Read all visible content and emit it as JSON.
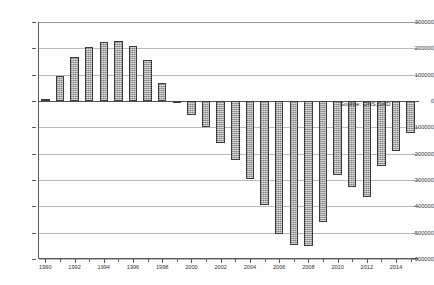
{
  "chart_data": {
    "type": "bar",
    "title": "",
    "subtitle": "",
    "xlabel": "",
    "ylabel": "",
    "ylim": [
      -600000,
      300000
    ],
    "ytick_step": 100000,
    "grid": true,
    "legend": false,
    "annotation": "Source: ONS,GAD",
    "ytick_labels": [
      "300000",
      "200000",
      "100000",
      "0",
      "-100000",
      "-200000",
      "-300000",
      "-400000",
      "-500000",
      "-600000"
    ],
    "ytick_values": [
      300000,
      200000,
      100000,
      0,
      -100000,
      -200000,
      -300000,
      -400000,
      -500000,
      -600000
    ],
    "xtick_labels": [
      "1990",
      "1992",
      "1994",
      "1996",
      "1998",
      "2000",
      "2002",
      "2004",
      "2006",
      "2008",
      "2010",
      "2012",
      "2014"
    ],
    "xtick_values": [
      1990,
      1992,
      1994,
      1996,
      1998,
      2000,
      2002,
      2004,
      2006,
      2008,
      2010,
      2012,
      2014
    ],
    "categories": [
      1990,
      1991,
      1992,
      1993,
      1994,
      1995,
      1996,
      1997,
      1998,
      1999,
      2000,
      2001,
      2002,
      2003,
      2004,
      2005,
      2006,
      2007,
      2008,
      2009,
      2010,
      2011,
      2012,
      2013,
      2014,
      2015
    ],
    "values": [
      8000,
      96000,
      166000,
      205000,
      225000,
      228000,
      208000,
      155000,
      70000,
      -4000,
      -55000,
      -100000,
      -160000,
      -225000,
      -295000,
      -395000,
      -505000,
      -545000,
      -550000,
      -460000,
      -280000,
      -325000,
      -365000,
      -245000,
      -190000,
      -120000
    ]
  },
  "source_note": "Source: ONS,GAD",
  "caption_remnant": ""
}
